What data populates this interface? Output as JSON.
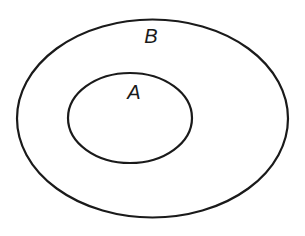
{
  "diagram": {
    "type": "venn-subset",
    "sets": [
      {
        "label": "B",
        "role": "outer",
        "ellipse": {
          "cx": 152.5,
          "cy": 118.5,
          "rx": 135.5,
          "ry": 99
        },
        "label_pos": {
          "x": 151,
          "y": 36
        }
      },
      {
        "label": "A",
        "role": "inner",
        "ellipse": {
          "cx": 130,
          "cy": 118,
          "rx": 62,
          "ry": 45
        },
        "label_pos": {
          "x": 134,
          "y": 92
        }
      }
    ],
    "stroke_color": "#1a1a1a",
    "background": "#ffffff"
  }
}
